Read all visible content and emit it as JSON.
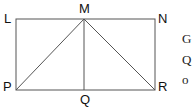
{
  "diagram": {
    "type": "geometry",
    "shape": "rectangle LNRP with segments MP, MQ, MR",
    "points": {
      "L": {
        "label": "L",
        "x": 16,
        "y": 19
      },
      "M": {
        "label": "M",
        "x": 84,
        "y": 19
      },
      "N": {
        "label": "N",
        "x": 155,
        "y": 19
      },
      "P": {
        "label": "P",
        "x": 16,
        "y": 90
      },
      "Q": {
        "label": "Q",
        "x": 84,
        "y": 90
      },
      "R": {
        "label": "R",
        "x": 155,
        "y": 90
      }
    },
    "segments": [
      [
        "L",
        "N"
      ],
      [
        "N",
        "R"
      ],
      [
        "R",
        "P"
      ],
      [
        "P",
        "L"
      ],
      [
        "M",
        "P"
      ],
      [
        "M",
        "Q"
      ],
      [
        "M",
        "R"
      ]
    ],
    "line_color": "#555555"
  },
  "side_text": [
    "G",
    "Q",
    "o"
  ]
}
